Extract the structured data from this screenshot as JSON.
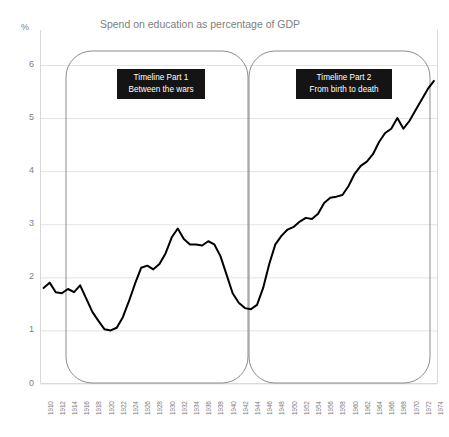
{
  "chart_data": {
    "type": "line",
    "title": "Spend on education as percentage of GDP",
    "xlabel": "",
    "ylabel": "%",
    "ylim": [
      0,
      6.5
    ],
    "yticks": [
      0,
      1,
      2,
      3,
      4,
      5,
      6
    ],
    "grid": true,
    "legend": "none",
    "series_name": "Spend on education as percentage of GDP",
    "line_color": "#000000",
    "x": [
      1910,
      1911,
      1912,
      1913,
      1914,
      1915,
      1916,
      1917,
      1918,
      1919,
      1920,
      1921,
      1922,
      1923,
      1924,
      1925,
      1926,
      1927,
      1928,
      1929,
      1930,
      1931,
      1932,
      1933,
      1934,
      1935,
      1936,
      1937,
      1938,
      1939,
      1940,
      1941,
      1942,
      1943,
      1944,
      1945,
      1946,
      1947,
      1948,
      1949,
      1950,
      1951,
      1952,
      1953,
      1954,
      1955,
      1956,
      1957,
      1958,
      1959,
      1960,
      1961,
      1962,
      1963,
      1964,
      1965,
      1966,
      1967,
      1968,
      1969,
      1970,
      1971,
      1972,
      1973,
      1974
    ],
    "values": [
      1.8,
      1.9,
      1.72,
      1.7,
      1.78,
      1.72,
      1.85,
      1.6,
      1.35,
      1.18,
      1.02,
      1.0,
      1.05,
      1.25,
      1.55,
      1.88,
      2.18,
      2.22,
      2.15,
      2.25,
      2.45,
      2.75,
      2.92,
      2.72,
      2.62,
      2.62,
      2.6,
      2.68,
      2.62,
      2.4,
      2.05,
      1.7,
      1.52,
      1.42,
      1.4,
      1.48,
      1.8,
      2.25,
      2.62,
      2.78,
      2.9,
      2.95,
      3.05,
      3.12,
      3.1,
      3.2,
      3.4,
      3.5,
      3.52,
      3.55,
      3.72,
      3.95,
      4.1,
      4.18,
      4.32,
      4.55,
      4.72,
      4.8,
      5.0,
      4.8,
      4.95,
      5.15,
      5.35,
      5.55,
      5.7
    ],
    "xticks": [
      1910,
      1912,
      1914,
      1916,
      1918,
      1920,
      1922,
      1924,
      1926,
      1928,
      1930,
      1932,
      1934,
      1936,
      1938,
      1940,
      1942,
      1944,
      1946,
      1948,
      1950,
      1952,
      1954,
      1956,
      1958,
      1960,
      1962,
      1964,
      1966,
      1968,
      1970,
      1972,
      1974
    ],
    "annotations": [
      {
        "name": "timeline-part-1",
        "line1": "Timeline Part 1",
        "line2": "Between the wars"
      },
      {
        "name": "timeline-part-2",
        "line1": "Timeline Part 2",
        "line2": "From birth to death"
      }
    ]
  }
}
